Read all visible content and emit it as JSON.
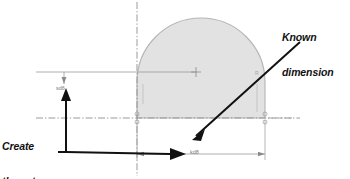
{
  "canvas": {
    "width": 350,
    "height": 179,
    "background": "#ffffff"
  },
  "colors": {
    "shape_fill": "#e2e2e2",
    "shape_stroke": "#b5b5b5",
    "dimension_line": "#9a9a9a",
    "centerline": "#8f8f8f",
    "annotation_text": "#111111",
    "annotation_leader": "#111111",
    "dimension_text": "#7a7a7a"
  },
  "annotations": [
    {
      "id": "known-dimension",
      "lines": [
        "Known",
        "dimension"
      ],
      "style": "bold-italic"
    },
    {
      "id": "create-two-dimensions",
      "lines": [
        "Create",
        "these two",
        "dimensions"
      ],
      "style": "bold-italic"
    }
  ],
  "annotation_known": {
    "line1": "Known",
    "line2": "dimension"
  },
  "annotation_create": {
    "line1": "Create",
    "line2": "these two",
    "line3": "dimensions"
  },
  "dimensions": [
    {
      "id": "vertical-height",
      "label": "sd6",
      "orientation": "vertical",
      "position": "left"
    },
    {
      "id": "horizontal-width",
      "label": "kd8",
      "orientation": "horizontal",
      "position": "bottom"
    }
  ],
  "dimension_left": {
    "label": "sd6"
  },
  "dimension_bottom": {
    "label": "kd8"
  },
  "sketch": {
    "shape": "d-shape-arc-over-rectangle",
    "arc_label": "R",
    "center_mark": "+",
    "centerline_vertical_x": 137,
    "centerline_horizontal_y": 118,
    "shape_left_x": 137,
    "shape_right_x": 265,
    "shape_base_y": 118,
    "arc_top_y": 18
  },
  "sketch_marks": {
    "arc_radius_tag": "R",
    "left_constraint_tag": "•",
    "right_constraint_tag": "•"
  }
}
